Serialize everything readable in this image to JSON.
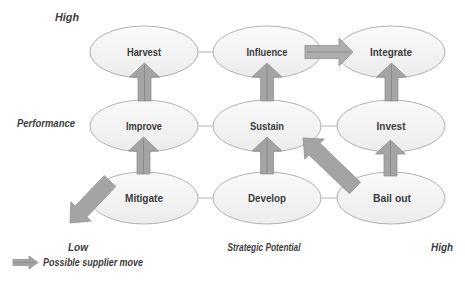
{
  "figure": {
    "type": "3x3-strategy-matrix",
    "axes": {
      "y_axis_label": "Performance",
      "y_high": "High",
      "y_low": "Low",
      "x_axis_label": "Strategic Potential",
      "x_high": "High"
    },
    "legend": {
      "icon": "supplier-move-arrow-icon",
      "label": "Possible supplier move"
    },
    "nodes": [
      {
        "label": "Harvest",
        "row": "high-performance",
        "col": "low-potential"
      },
      {
        "label": "Influence",
        "row": "high-performance",
        "col": "mid-potential"
      },
      {
        "label": "Integrate",
        "row": "high-performance",
        "col": "high-potential"
      },
      {
        "label": "Improve",
        "row": "mid-performance",
        "col": "low-potential"
      },
      {
        "label": "Sustain",
        "row": "mid-performance",
        "col": "mid-potential"
      },
      {
        "label": "Invest",
        "row": "mid-performance",
        "col": "high-potential"
      },
      {
        "label": "Mitigate",
        "row": "low-performance",
        "col": "low-potential"
      },
      {
        "label": "Develop",
        "row": "low-performance",
        "col": "mid-potential"
      },
      {
        "label": "Bail out",
        "row": "low-performance",
        "col": "high-potential"
      }
    ],
    "moves": [
      {
        "from": "Improve",
        "to": "Harvest",
        "direction": "up"
      },
      {
        "from": "Sustain",
        "to": "Influence",
        "direction": "up"
      },
      {
        "from": "Invest",
        "to": "Integrate",
        "direction": "up"
      },
      {
        "from": "Mitigate",
        "to": "Improve",
        "direction": "up"
      },
      {
        "from": "Develop",
        "to": "Sustain",
        "direction": "up"
      },
      {
        "from": "Bail out",
        "to": "Invest",
        "direction": "up"
      },
      {
        "from": "Influence",
        "to": "Integrate",
        "direction": "right"
      },
      {
        "from": "Bail out",
        "to": "Sustain",
        "direction": "up-left"
      },
      {
        "from": "Mitigate",
        "to": "exit-matrix",
        "direction": "down-left"
      }
    ],
    "colors": {
      "arrow": "#a4a4a4",
      "arrow_outline": "#8f8f8f",
      "ellipse_fill": "#f4f4f4",
      "ellipse_stroke": "#b2b2b2",
      "text": "#3c3c3c",
      "background": "#ffffff"
    }
  }
}
